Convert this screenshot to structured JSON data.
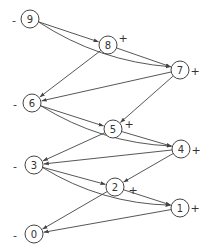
{
  "diagram": {
    "nodes": [
      {
        "id": "9",
        "label": "9",
        "x": 30,
        "y": 19,
        "sign": "-",
        "sign_x": 14,
        "sign_y": 20
      },
      {
        "id": "8",
        "label": "8",
        "x": 108,
        "y": 45,
        "sign": "+",
        "sign_x": 123,
        "sign_y": 38
      },
      {
        "id": "7",
        "label": "7",
        "x": 180,
        "y": 70,
        "sign": "+",
        "sign_x": 195,
        "sign_y": 71
      },
      {
        "id": "6",
        "label": "6",
        "x": 32,
        "y": 103,
        "sign": "-",
        "sign_x": 15,
        "sign_y": 104
      },
      {
        "id": "5",
        "label": "5",
        "x": 113,
        "y": 129,
        "sign": "+",
        "sign_x": 129,
        "sign_y": 124
      },
      {
        "id": "4",
        "label": "4",
        "x": 181,
        "y": 149,
        "sign": "+",
        "sign_x": 196,
        "sign_y": 150
      },
      {
        "id": "3",
        "label": "3",
        "x": 34,
        "y": 165,
        "sign": "-",
        "sign_x": 15,
        "sign_y": 166
      },
      {
        "id": "2",
        "label": "2",
        "x": 115,
        "y": 187,
        "sign": "+",
        "sign_x": 133,
        "sign_y": 190
      },
      {
        "id": "1",
        "label": "1",
        "x": 180,
        "y": 208,
        "sign": "+",
        "sign_x": 195,
        "sign_y": 208
      },
      {
        "id": "0",
        "label": "0",
        "x": 34,
        "y": 234,
        "sign": "-",
        "sign_x": 15,
        "sign_y": 235
      }
    ],
    "edges": [
      {
        "from": "9",
        "to": "8",
        "curve": 0
      },
      {
        "from": "9",
        "to": "7",
        "curve": 18
      },
      {
        "from": "8",
        "to": "7",
        "curve": 0
      },
      {
        "from": "8",
        "to": "6",
        "curve": 0
      },
      {
        "from": "7",
        "to": "6",
        "curve": 0
      },
      {
        "from": "7",
        "to": "5",
        "curve": 0
      },
      {
        "from": "6",
        "to": "5",
        "curve": 0
      },
      {
        "from": "6",
        "to": "4",
        "curve": 18
      },
      {
        "from": "5",
        "to": "4",
        "curve": 0
      },
      {
        "from": "5",
        "to": "3",
        "curve": 0
      },
      {
        "from": "4",
        "to": "3",
        "curve": 0
      },
      {
        "from": "4",
        "to": "2",
        "curve": 0
      },
      {
        "from": "3",
        "to": "2",
        "curve": 0
      },
      {
        "from": "3",
        "to": "1",
        "curve": 18
      },
      {
        "from": "2",
        "to": "1",
        "curve": 0
      },
      {
        "from": "2",
        "to": "0",
        "curve": 0
      },
      {
        "from": "1",
        "to": "0",
        "curve": 0
      }
    ],
    "node_radius": 9,
    "stroke_color": "#444444",
    "background": "#ffffff"
  }
}
